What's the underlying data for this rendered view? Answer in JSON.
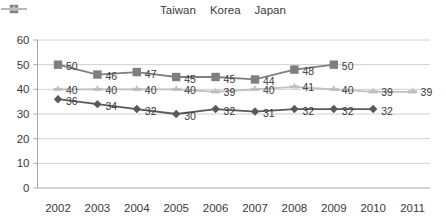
{
  "chart_data": {
    "type": "line",
    "title": "",
    "xlabel": "",
    "ylabel": "",
    "categories": [
      "2002",
      "2003",
      "2004",
      "2005",
      "2006",
      "2007",
      "2008",
      "2009",
      "2010",
      "2011"
    ],
    "ylim": [
      0,
      60
    ],
    "ytick_step": 10,
    "yticks": [
      0,
      10,
      20,
      30,
      40,
      50,
      60
    ],
    "grid": true,
    "legend_position": "top-center",
    "data_labels": true,
    "series": [
      {
        "name": "Taiwan",
        "marker": "diamond",
        "color": "#595959",
        "values": [
          36,
          34,
          32,
          30,
          32,
          31,
          32,
          32,
          32,
          null
        ]
      },
      {
        "name": "Korea",
        "marker": "square",
        "color": "#7f7f7f",
        "values": [
          50,
          46,
          47,
          45,
          45,
          44,
          48,
          50,
          null,
          null
        ]
      },
      {
        "name": "Japan",
        "marker": "cross",
        "color": "#bfbfbf",
        "values": [
          40,
          40,
          40,
          40,
          39,
          40,
          41,
          40,
          39,
          39
        ]
      }
    ]
  },
  "axis": {
    "ytick_labels": [
      "0",
      "10",
      "20",
      "30",
      "40",
      "50",
      "60"
    ],
    "xtick_labels": [
      "2002",
      "2003",
      "2004",
      "2005",
      "2006",
      "2007",
      "2008",
      "2009",
      "2010",
      "2011"
    ]
  },
  "legend": {
    "items": [
      {
        "label": "Taiwan",
        "color": "#595959",
        "marker": "diamond"
      },
      {
        "label": "Korea",
        "color": "#7f7f7f",
        "marker": "square"
      },
      {
        "label": "Japan",
        "color": "#bfbfbf",
        "marker": "cross"
      }
    ]
  },
  "colors": {
    "taiwan": "#595959",
    "korea": "#7f7f7f",
    "japan": "#bfbfbf",
    "grid": "#d0d0d0",
    "axis": "#a6a6a6",
    "text": "#3a3a3a",
    "background": "#ffffff"
  }
}
